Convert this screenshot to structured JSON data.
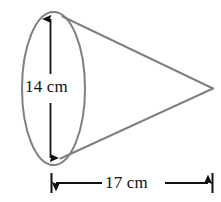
{
  "figure": {
    "name": "cone-dimension-diagram",
    "shape": "cone",
    "background_color": "#ffffff",
    "outline_color": "#808080",
    "annotation_color": "#111111",
    "dimensions": {
      "height_label": "14 cm",
      "height_value": 14,
      "width_label": "17 cm",
      "width_value": 17,
      "units": "cm"
    },
    "labels": {
      "diameter": "14 cm",
      "length": "17 cm"
    },
    "icons": {
      "vertical_double_arrow": "double-arrow-vertical-icon",
      "horizontal_double_arrow": "double-arrow-horizontal-icon",
      "base_ellipse": "ellipse-icon",
      "cone-body": "cone-outline-icon"
    }
  }
}
